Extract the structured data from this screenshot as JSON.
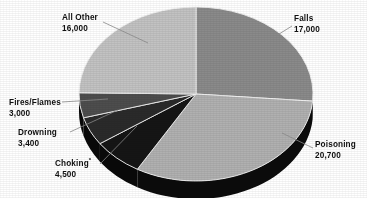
{
  "chart_data": {
    "type": "pie",
    "title": "",
    "subtitle": "",
    "xlabel": "",
    "ylabel": "",
    "legend_position": "none",
    "grid": false,
    "three_d": true,
    "total": 64600,
    "categories": [
      "Falls",
      "Poisoning",
      "Choking*",
      "Drowning",
      "Fires/Flames",
      "All Other"
    ],
    "values": [
      17000,
      20700,
      4500,
      3400,
      3000,
      16000
    ],
    "value_labels": [
      "17,000",
      "20,700",
      "4,500",
      "3,400",
      "3,000",
      "16,000"
    ],
    "slices": [
      {
        "name": "Falls",
        "label": "Falls",
        "value": 17000,
        "value_label": "17,000",
        "color": "#8a8a8a",
        "side_color": "#0b0b0b",
        "start_deg": 0.0,
        "end_deg": 94.7
      },
      {
        "name": "Poisoning",
        "label": "Poisoning",
        "value": 20700,
        "value_label": "20,700",
        "color": "#b0b0b0",
        "side_color": "#0b0b0b",
        "start_deg": 94.7,
        "end_deg": 210.1
      },
      {
        "name": "Choking",
        "label": "Choking",
        "value": 4500,
        "value_label": "4,500",
        "color": "#151515",
        "side_color": "#090909",
        "start_deg": 210.1,
        "end_deg": 235.2,
        "footnote": "*"
      },
      {
        "name": "Drowning",
        "label": "Drowning",
        "value": 3400,
        "value_label": "3,400",
        "color": "#2a2a2a",
        "side_color": "#090909",
        "start_deg": 235.2,
        "end_deg": 254.1
      },
      {
        "name": "Fires/Flames",
        "label": "Fires/Flames",
        "value": 3000,
        "value_label": "3,000",
        "color": "#4d4d4d",
        "side_color": "#090909",
        "start_deg": 254.1,
        "end_deg": 270.8
      },
      {
        "name": "All Other",
        "label": "All Other",
        "value": 16000,
        "value_label": "16,000",
        "color": "#c2c2c2",
        "side_color": "#0b0b0b",
        "start_deg": 270.8,
        "end_deg": 360.0
      }
    ]
  },
  "labels": {
    "all_other": {
      "name": "All Other",
      "value": "16,000"
    },
    "falls": {
      "name": "Falls",
      "value": "17,000"
    },
    "poisoning": {
      "name": "Poisoning",
      "value": "20,700"
    },
    "fires_flames": {
      "name": "Fires/Flames",
      "value": "3,000"
    },
    "drowning": {
      "name": "Drowning",
      "value": "3,400"
    },
    "choking": {
      "name": "Choking",
      "value": "4,500",
      "footnote_marker": "*"
    }
  },
  "colors": {
    "background": "#ffffff",
    "text": "#101010",
    "leader_line": "#8c8c8c",
    "falls": "#8a8a8a",
    "poisoning": "#b0b0b0",
    "choking": "#151515",
    "drowning": "#2a2a2a",
    "fires_flames": "#4d4d4d",
    "all_other": "#c2c2c2",
    "pie_side_wall": "#0b0b0b",
    "slice_divider": "#f2f2f2"
  },
  "geometry": {
    "center_x": 196,
    "center_y": 94,
    "radius_x": 117,
    "radius_y": 87,
    "depth": 18
  }
}
